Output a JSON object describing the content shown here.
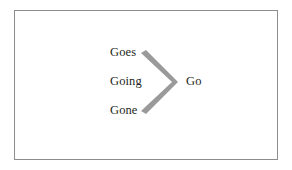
{
  "figure": {
    "type": "chevron-convergence-diagram",
    "background_color": "#ffffff",
    "frame_color": "#8d8d8d",
    "text_color": "#231f20",
    "chevron_color": "#9a9a9a",
    "inputs": [
      {
        "label": "Goes"
      },
      {
        "label": "Going"
      },
      {
        "label": "Gone"
      }
    ],
    "output": {
      "label": "Go"
    },
    "chevron": {
      "name": "chevron-right",
      "points": "0,5 5,2 37,34 5,66 0,63 31,34"
    }
  }
}
